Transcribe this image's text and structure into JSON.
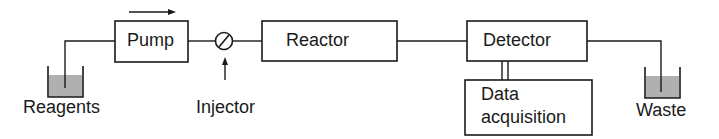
{
  "diagram": {
    "type": "flow-injection-analysis-schematic",
    "flow_direction": "left-to-right",
    "components": {
      "reagents": {
        "label": "Reagents",
        "kind": "reservoir"
      },
      "pump": {
        "label": "Pump",
        "kind": "box"
      },
      "injector": {
        "label": "Injector",
        "kind": "valve"
      },
      "reactor": {
        "label": "Reactor",
        "kind": "box"
      },
      "detector": {
        "label": "Detector",
        "kind": "box"
      },
      "data_acquisition": {
        "label_line1": "Data",
        "label_line2": "acquisition",
        "kind": "box"
      },
      "waste": {
        "label": "Waste",
        "kind": "reservoir"
      }
    },
    "connections": [
      {
        "from": "Reagents",
        "to": "Pump"
      },
      {
        "from": "Pump",
        "to": "Injector"
      },
      {
        "from": "Injector",
        "to": "Reactor"
      },
      {
        "from": "Reactor",
        "to": "Detector"
      },
      {
        "from": "Detector",
        "to": "Waste"
      },
      {
        "from": "Detector",
        "to": "Data acquisition",
        "style": "double-line"
      }
    ],
    "colors": {
      "stroke": "#1a1a1a",
      "liquid": "#b0b0b0",
      "background": "#ffffff"
    }
  }
}
